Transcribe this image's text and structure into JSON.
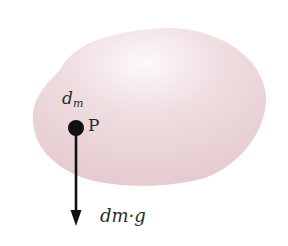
{
  "diagram": {
    "body": {
      "name": "rigid-body",
      "fill": "#e9d3d7",
      "highlight": "#fbf3f5"
    },
    "point": {
      "label": "P",
      "mass_element_label": "d",
      "mass_element_subscript": "m"
    },
    "force": {
      "label": "dm·g",
      "direction": "down",
      "color": "#111111"
    }
  }
}
